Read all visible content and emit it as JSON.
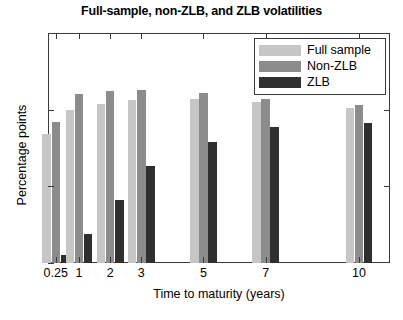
{
  "chart_data": {
    "type": "bar",
    "title": "Full-sample, non-ZLB, and ZLB volatilities",
    "xlabel": "Time to maturity (years)",
    "ylabel": "Percentage points",
    "categories": [
      "0.25",
      "1",
      "2",
      "3",
      "5",
      "7",
      "10"
    ],
    "series": [
      {
        "name": "Full sample",
        "color": "#c6c6c6",
        "values": [
          0.84,
          1.0,
          1.04,
          1.06,
          1.07,
          1.05,
          1.01
        ]
      },
      {
        "name": "Non-ZLB",
        "color": "#8c8c8c",
        "values": [
          0.92,
          1.1,
          1.12,
          1.13,
          1.11,
          1.07,
          1.03
        ]
      },
      {
        "name": "ZLB",
        "color": "#2f2f2f",
        "values": [
          0.05,
          0.19,
          0.41,
          0.63,
          0.79,
          0.89,
          0.91
        ]
      }
    ],
    "ylim": [
      0,
      1.5
    ],
    "yticks": [
      0,
      0.5,
      1,
      1.5
    ],
    "ytick_labels": [
      "0",
      "0.5",
      "1",
      "1.5"
    ],
    "grid": false,
    "legend_position": "top-right"
  },
  "legend": {
    "entries": [
      {
        "label": "Full sample"
      },
      {
        "label": "Non-ZLB"
      },
      {
        "label": "ZLB"
      }
    ]
  }
}
